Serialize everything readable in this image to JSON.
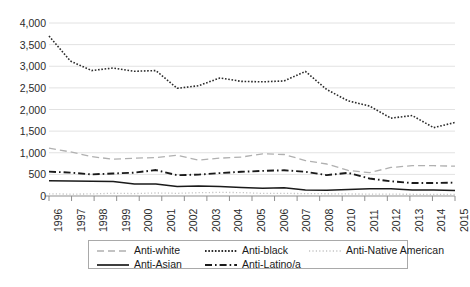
{
  "chart_data": {
    "type": "line",
    "title": "",
    "subtitle": "",
    "xlabel": "",
    "ylabel": "",
    "x": [
      "1996",
      "1997",
      "1998",
      "1999",
      "2000",
      "2001",
      "2002",
      "2003",
      "2004",
      "2005",
      "2006",
      "2007",
      "2008",
      "2009",
      "2010",
      "2011",
      "2012",
      "2013",
      "2014",
      "2015"
    ],
    "xtick_labels": [
      "1996",
      "1997",
      "1998",
      "1999",
      "2000",
      "2001",
      "2002",
      "2003",
      "2004",
      "2005",
      "2006",
      "2007",
      "2008",
      "2010",
      "2011",
      "2012",
      "2013",
      "2014",
      "2015"
    ],
    "ytick_labels": [
      "0",
      "500",
      "1,000",
      "1,500",
      "2,000",
      "2,500",
      "3,000",
      "3,500",
      "4,000"
    ],
    "ytick_values": [
      0,
      500,
      1000,
      1500,
      2000,
      2500,
      3000,
      3500,
      4000
    ],
    "ylim": [
      0,
      4000
    ],
    "grid": "horizontal",
    "legend_position": "bottom",
    "series": [
      {
        "name": "Anti-white",
        "style": "dashed",
        "color": "#b0b0b0",
        "values": [
          1106,
          1020,
          910,
          850,
          875,
          890,
          940,
          830,
          875,
          900,
          975,
          960,
          820,
          740,
          590,
          540,
          660,
          700,
          700,
          690
        ]
      },
      {
        "name": "Anti-black",
        "style": "dotted",
        "color": "#2b2b2b",
        "values": [
          3700,
          3120,
          2900,
          2960,
          2884,
          2900,
          2490,
          2550,
          2730,
          2650,
          2640,
          2660,
          2880,
          2460,
          2200,
          2080,
          1800,
          1860,
          1580,
          1700
        ]
      },
      {
        "name": "Anti-Native American",
        "style": "fine-dotted",
        "color": "#c4c4c4",
        "values": [
          51,
          44,
          48,
          64,
          56,
          70,
          62,
          76,
          83,
          79,
          60,
          61,
          55,
          52,
          47,
          45,
          42,
          40,
          37,
          35
        ]
      },
      {
        "name": "Anti-Asian",
        "style": "solid",
        "color": "#1a1a1a",
        "values": [
          355,
          347,
          340,
          335,
          280,
          280,
          217,
          231,
          217,
          199,
          181,
          188,
          137,
          135,
          150,
          165,
          170,
          140,
          140,
          125
        ]
      },
      {
        "name": "Anti-Latino/a",
        "style": "dash-dot",
        "color": "#1a1a1a",
        "values": [
          564,
          540,
          500,
          520,
          540,
          600,
          480,
          495,
          530,
          560,
          580,
          595,
          561,
          483,
          534,
          405,
          340,
          299,
          299,
          310
        ]
      }
    ]
  },
  "legend": {
    "items": [
      {
        "label": "Anti-white"
      },
      {
        "label": "Anti-black"
      },
      {
        "label": "Anti-Native American"
      },
      {
        "label": "Anti-Asian"
      },
      {
        "label": "Anti-Latino/a"
      }
    ]
  }
}
